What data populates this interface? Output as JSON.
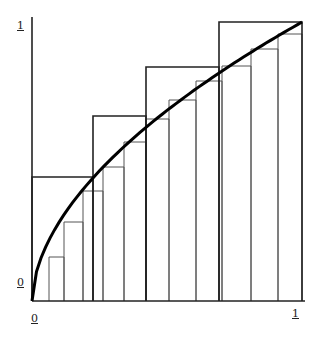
{
  "axes": {
    "y_top_label": "1",
    "y_bottom_label": "0",
    "x_left_label": "0",
    "x_right_label": "1"
  },
  "colors": {
    "curve": "#000000",
    "outer": "#222222",
    "inner": "#555555"
  },
  "geometry": {
    "origin": [
      32,
      301
    ],
    "x_end": 302,
    "y_top": 22
  },
  "chart_data": {
    "type": "area",
    "title": "",
    "xlabel": "",
    "ylabel": "",
    "xlim": [
      0,
      1
    ],
    "ylim": [
      0,
      1
    ],
    "grid": false,
    "curve": "concave increasing function from (0,0) to (1,1)",
    "outer_rectangles_px": [
      {
        "x0": 32,
        "x1": 93,
        "top": 177
      },
      {
        "x0": 93,
        "x1": 146,
        "top": 116
      },
      {
        "x0": 146,
        "x1": 219,
        "top": 67
      },
      {
        "x0": 219,
        "x1": 302,
        "top": 22
      }
    ],
    "inner_rectangles_px": [
      {
        "x0": 49,
        "x1": 64,
        "top": 257
      },
      {
        "x0": 64,
        "x1": 83,
        "top": 222
      },
      {
        "x0": 83,
        "x1": 103,
        "top": 191
      },
      {
        "x0": 103,
        "x1": 124,
        "top": 167
      },
      {
        "x0": 124,
        "x1": 146,
        "top": 142
      },
      {
        "x0": 146,
        "x1": 169,
        "top": 119
      },
      {
        "x0": 169,
        "x1": 196,
        "top": 100
      },
      {
        "x0": 196,
        "x1": 222,
        "top": 81
      },
      {
        "x0": 222,
        "x1": 251,
        "top": 66
      },
      {
        "x0": 251,
        "x1": 278,
        "top": 49
      },
      {
        "x0": 278,
        "x1": 302,
        "top": 34
      }
    ]
  }
}
